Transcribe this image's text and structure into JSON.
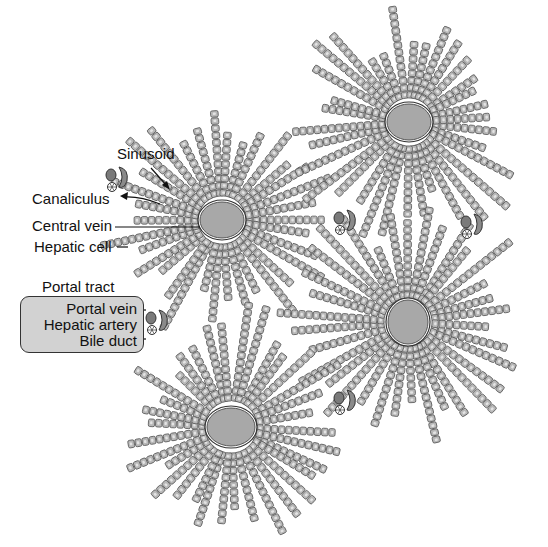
{
  "figure": {
    "labels": {
      "sinusoid": "Sinusoid",
      "canaliculus": "Canaliculus",
      "central_vein": "Central vein",
      "hepatic_cell": "Hepatic cell",
      "portal_tract": "Portal tract",
      "portal_vein": "Portal vein",
      "hepatic_artery": "Hepatic artery",
      "bile_duct": "Bile duct"
    },
    "colors": {
      "cell_fill": "#b8b8b8",
      "cell_border": "#555555",
      "vein_fill": "#a8a8a8",
      "portal_box_fill": "#d2d2d2",
      "text": "#111111"
    },
    "lobules": [
      {
        "cx": 222,
        "cy": 220,
        "rx": 22,
        "ry": 18,
        "cords": 34,
        "minLen": 55,
        "maxLen": 105
      },
      {
        "cx": 409,
        "cy": 122,
        "rx": 22,
        "ry": 18,
        "cords": 34,
        "minLen": 55,
        "maxLen": 110
      },
      {
        "cx": 408,
        "cy": 322,
        "rx": 20,
        "ry": 22,
        "cords": 34,
        "minLen": 60,
        "maxLen": 110
      },
      {
        "cx": 231,
        "cy": 427,
        "rx": 24,
        "ry": 19,
        "cords": 34,
        "minLen": 55,
        "maxLen": 105
      }
    ],
    "portal_tracts": [
      {
        "x": 117,
        "y": 175
      },
      {
        "x": 345,
        "y": 218
      },
      {
        "x": 472,
        "y": 222
      },
      {
        "x": 157,
        "y": 318
      },
      {
        "x": 345,
        "y": 398
      }
    ]
  }
}
